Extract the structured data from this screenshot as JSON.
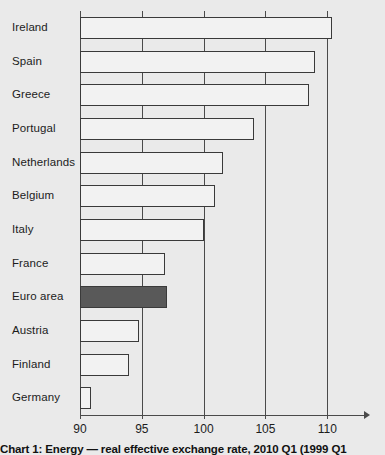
{
  "chart_data": {
    "type": "bar",
    "orientation": "horizontal",
    "title": "",
    "subtitle": "",
    "caption": "Chart 1: Energy — real effective exchange rate, 2010 Q1 (1999 Q1",
    "xlabel": "",
    "ylabel": "",
    "xlim": [
      90,
      112
    ],
    "xticks": [
      90,
      95,
      100,
      105,
      110
    ],
    "xtick_labels": [
      "90",
      "95",
      "100",
      "105",
      "110"
    ],
    "grid": "vertical-only",
    "legend": "none",
    "highlight_category": "Euro area",
    "categories": [
      "Ireland",
      "Spain",
      "Greece",
      "Portugal",
      "Netherlands",
      "Belgium",
      "Italy",
      "France",
      "Euro area",
      "Austria",
      "Finland",
      "Germany"
    ],
    "values": [
      110.4,
      109.0,
      108.5,
      104.1,
      101.6,
      100.9,
      100.0,
      96.9,
      97.0,
      94.8,
      94.0,
      90.9
    ]
  },
  "colors": {
    "background": "#eaeaea",
    "bar_fill": "#f2f2f2",
    "bar_stroke": "#3a3a3a",
    "highlight_fill": "#595959",
    "axis": "#4a4a4a",
    "text": "#1c1c1c"
  }
}
